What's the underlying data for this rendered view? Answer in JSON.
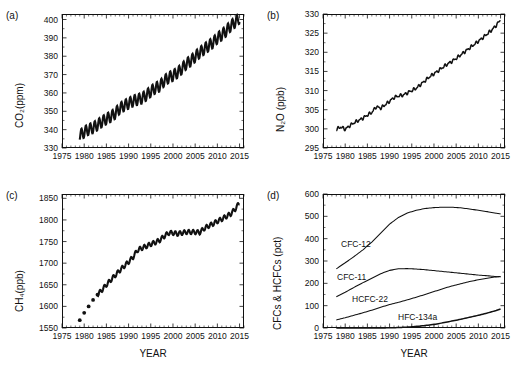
{
  "figure": {
    "panels": [
      "a",
      "b",
      "c",
      "d"
    ],
    "xlabel": "YEAR",
    "caption": ""
  },
  "chart_data": [
    {
      "type": "line",
      "panel": "(a)",
      "title": "",
      "xlabel": "",
      "ylabel": "CO₂(ppm)",
      "xlim": [
        1975,
        2016
      ],
      "ylim": [
        330,
        403
      ],
      "yticks": [
        330,
        340,
        350,
        360,
        370,
        380,
        390,
        400
      ],
      "xticks": [
        1975,
        1980,
        1985,
        1990,
        1995,
        2000,
        2005,
        2010,
        2015
      ],
      "grid": false,
      "legend": "none",
      "note": "monthly record with strong annual sawtooth cycle, amplitude ~6 ppm",
      "x": [
        1979,
        1980,
        1981,
        1982,
        1983,
        1984,
        1985,
        1986,
        1987,
        1988,
        1989,
        1990,
        1991,
        1992,
        1993,
        1994,
        1995,
        1996,
        1997,
        1998,
        1999,
        2000,
        2001,
        2002,
        2003,
        2004,
        2005,
        2006,
        2007,
        2008,
        2009,
        2010,
        2011,
        2012,
        2013,
        2014,
        2015
      ],
      "values": [
        336.8,
        338.7,
        340.1,
        341.0,
        342.6,
        344.3,
        345.8,
        347.1,
        348.9,
        351.5,
        353.1,
        354.3,
        355.6,
        356.4,
        357.1,
        358.8,
        360.8,
        362.6,
        363.7,
        366.6,
        368.3,
        369.5,
        371.0,
        373.2,
        375.8,
        377.5,
        379.8,
        381.9,
        383.8,
        385.6,
        387.4,
        389.9,
        391.6,
        393.8,
        396.5,
        398.6,
        400.8
      ]
    },
    {
      "type": "line",
      "panel": "(b)",
      "title": "",
      "xlabel": "",
      "ylabel": "N₂O (ppb)",
      "xlim": [
        1975,
        2016
      ],
      "ylim": [
        295,
        330
      ],
      "yticks": [
        295,
        300,
        305,
        310,
        315,
        320,
        325,
        330
      ],
      "xticks": [
        1975,
        1980,
        1985,
        1990,
        1995,
        2000,
        2005,
        2010,
        2015
      ],
      "grid": false,
      "legend": "none",
      "note": "steady rise with small irregular interannual wiggles",
      "x": [
        1978,
        1979,
        1980,
        1981,
        1982,
        1983,
        1984,
        1985,
        1986,
        1987,
        1988,
        1989,
        1990,
        1991,
        1992,
        1993,
        1994,
        1995,
        1996,
        1997,
        1998,
        1999,
        2000,
        2001,
        2002,
        2003,
        2004,
        2005,
        2006,
        2007,
        2008,
        2009,
        2010,
        2011,
        2012,
        2013,
        2014,
        2015
      ],
      "values": [
        299.9,
        300.5,
        299.9,
        300.8,
        301.6,
        302.2,
        302.8,
        303.6,
        304.3,
        305.8,
        305.4,
        306.3,
        307.2,
        308.2,
        308.6,
        308.8,
        309.4,
        310.0,
        310.6,
        311.6,
        312.6,
        313.6,
        314.4,
        315.2,
        316.1,
        316.9,
        317.6,
        318.4,
        319.3,
        320.2,
        321.1,
        322.0,
        322.9,
        323.8,
        324.8,
        325.8,
        327.0,
        328.5
      ]
    },
    {
      "type": "line",
      "panel": "(c)",
      "title": "",
      "xlabel": "",
      "ylabel": "CH₄(ppb)",
      "xlim": [
        1975,
        2016
      ],
      "ylim": [
        1550,
        1860
      ],
      "yticks": [
        1550,
        1600,
        1650,
        1700,
        1750,
        1800,
        1850
      ],
      "xticks": [
        1975,
        1980,
        1985,
        1990,
        1995,
        2000,
        2005,
        2010,
        2015
      ],
      "grid": false,
      "legend": "none",
      "note": "early years (1979-1983) are discrete annual points; continuous monthly record afterwards with plateau 1999-2006",
      "x": [
        1979,
        1980,
        1981,
        1982,
        1983,
        1984,
        1985,
        1986,
        1987,
        1988,
        1989,
        1990,
        1991,
        1992,
        1993,
        1994,
        1995,
        1996,
        1997,
        1998,
        1999,
        2000,
        2001,
        2002,
        2003,
        2004,
        2005,
        2006,
        2007,
        2008,
        2009,
        2010,
        2011,
        2012,
        2013,
        2014,
        2015
      ],
      "values": [
        1568,
        1585,
        1600,
        1615,
        1627,
        1638,
        1650,
        1661,
        1672,
        1683,
        1693,
        1703,
        1714,
        1730,
        1735,
        1739,
        1744,
        1748,
        1753,
        1762,
        1770,
        1770,
        1768,
        1770,
        1772,
        1772,
        1772,
        1771,
        1780,
        1786,
        1791,
        1797,
        1802,
        1808,
        1814,
        1825,
        1840
      ],
      "discrete_points_x": [
        1979,
        1980,
        1981,
        1982,
        1983
      ],
      "discrete_points_y": [
        1568,
        1585,
        1600,
        1615,
        1627
      ]
    },
    {
      "type": "line",
      "panel": "(d)",
      "title": "",
      "xlabel": "",
      "ylabel": "CFCs & HCFCs (pct)",
      "xlim": [
        1975,
        2016
      ],
      "ylim": [
        0,
        600
      ],
      "yticks": [
        0,
        100,
        200,
        300,
        400,
        500,
        600
      ],
      "xticks": [
        1975,
        1980,
        1985,
        1990,
        1995,
        2000,
        2005,
        2010,
        2015
      ],
      "grid": false,
      "legend": "inline-labels",
      "x": [
        1978,
        1980,
        1982,
        1984,
        1986,
        1988,
        1990,
        1992,
        1994,
        1996,
        1998,
        2000,
        2002,
        2004,
        2006,
        2008,
        2010,
        2012,
        2014,
        2015
      ],
      "series": [
        {
          "name": "CFC-12",
          "label": "CFC-12",
          "values": [
            265,
            292,
            320,
            350,
            385,
            425,
            465,
            495,
            515,
            527,
            535,
            539,
            541,
            541,
            538,
            533,
            527,
            521,
            514,
            511
          ]
        },
        {
          "name": "CFC-11",
          "label": "CFC-11",
          "values": [
            140,
            160,
            182,
            203,
            223,
            243,
            258,
            265,
            266,
            264,
            261,
            257,
            253,
            249,
            245,
            241,
            237,
            234,
            230,
            229
          ]
        },
        {
          "name": "HCFC-22",
          "label": "HCFC-22",
          "values": [
            36,
            46,
            57,
            68,
            80,
            93,
            105,
            115,
            126,
            138,
            150,
            163,
            176,
            188,
            198,
            208,
            216,
            223,
            229,
            231
          ]
        },
        {
          "name": "HFC-134a",
          "label": "HFC-134a",
          "values": [
            0,
            0,
            0,
            0,
            0,
            0,
            1,
            2,
            4,
            7,
            11,
            16,
            23,
            31,
            39,
            48,
            57,
            67,
            78,
            85
          ]
        }
      ]
    }
  ]
}
